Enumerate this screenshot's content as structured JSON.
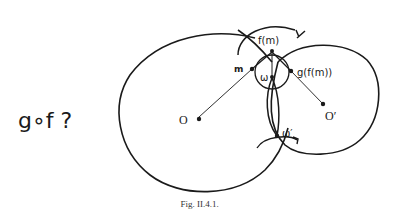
{
  "figure": {
    "caption": "Fig. II.4.1.",
    "question_label": "g∘f ?",
    "labels": {
      "center_O": "O",
      "center_O_prime": "O′",
      "point_m": "m",
      "point_f_m": "f(m)",
      "point_g_f_m": "g(f(m))",
      "point_omega": "ω",
      "point_omega_prime": "ω′"
    }
  },
  "colors": {
    "ink": "#1a1a1a",
    "background": "#ffffff"
  }
}
